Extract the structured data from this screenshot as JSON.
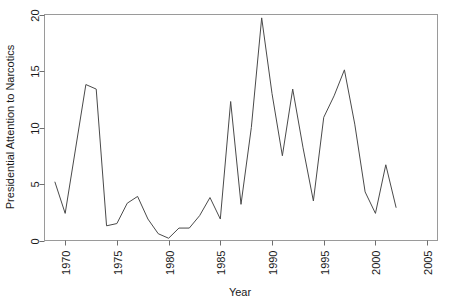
{
  "chart_data": {
    "type": "line",
    "title": "",
    "xlabel": "Year",
    "ylabel": "Presidential Attention to Narcotics",
    "xlim": [
      1968.0,
      2006.0
    ],
    "ylim": [
      0,
      20
    ],
    "grid": false,
    "legend": "none",
    "xticks": [
      1970,
      1975,
      1980,
      1985,
      1990,
      1995,
      2000,
      2005
    ],
    "xtick_labels": [
      "1970",
      "1975",
      "1980",
      "1985",
      "1990",
      "1995",
      "2000",
      "2005"
    ],
    "yticks": [
      0,
      5,
      10,
      15,
      20
    ],
    "ytick_labels": [
      "0",
      "5",
      "10",
      "15",
      "20"
    ],
    "line_color": "#4a4a4a",
    "x": [
      1969,
      1970,
      1971,
      1972,
      1973,
      1974,
      1975,
      1976,
      1977,
      1978,
      1979,
      1980,
      1981,
      1982,
      1983,
      1984,
      1985,
      1986,
      1987,
      1988,
      1989,
      1990,
      1991,
      1992,
      1993,
      1994,
      1995,
      1996,
      1997,
      1998,
      1999,
      2000,
      2001,
      2002
    ],
    "values": [
      5.2,
      2.4,
      8.1,
      13.8,
      13.4,
      1.3,
      1.5,
      3.3,
      3.9,
      1.9,
      0.6,
      0.2,
      1.1,
      1.1,
      2.2,
      3.8,
      1.9,
      12.3,
      3.2,
      10.0,
      19.7,
      13.0,
      7.5,
      13.4,
      8.2,
      3.5,
      10.9,
      12.8,
      15.1,
      10.3,
      4.3,
      2.4,
      6.7,
      2.9
    ],
    "series": [
      {
        "name": "Presidential Attention to Narcotics",
        "values": [
          5.2,
          2.4,
          8.1,
          13.8,
          13.4,
          1.3,
          1.5,
          3.3,
          3.9,
          1.9,
          0.6,
          0.2,
          1.1,
          1.1,
          2.2,
          3.8,
          1.9,
          12.3,
          3.2,
          10.0,
          19.7,
          13.0,
          7.5,
          13.4,
          8.2,
          3.5,
          10.9,
          12.8,
          15.1,
          10.3,
          4.3,
          2.4,
          6.7,
          2.9
        ]
      }
    ]
  }
}
